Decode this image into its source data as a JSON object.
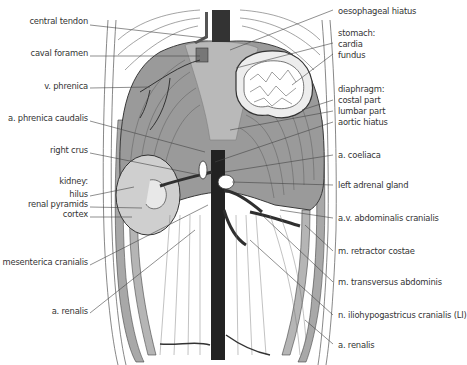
{
  "figure": {
    "colors": {
      "diaphragm": "#9a9a9a",
      "diaphragm_light": "#b9b9b9",
      "kidney": "#cfcfcf",
      "vessel": "#2f2f2f",
      "line": "#4a4a4a",
      "background": "#ffffff"
    },
    "labels_left": [
      {
        "text": "central tendon",
        "x": 98,
        "y": 20
      },
      {
        "text": "caval foramen",
        "x": 98,
        "y": 52
      },
      {
        "text": "v. phrenica",
        "x": 98,
        "y": 85
      },
      {
        "text": "a. phrenica caudalis",
        "x": 98,
        "y": 117
      },
      {
        "text": "right crus",
        "x": 98,
        "y": 149
      },
      {
        "text": "kidney:",
        "x": 98,
        "y": 180
      },
      {
        "text": "hilus",
        "x": 98,
        "y": 193
      },
      {
        "text": "renal pyramids",
        "x": 98,
        "y": 203
      },
      {
        "text": "cortex",
        "x": 98,
        "y": 213
      },
      {
        "text": "a. mesenterica cranialis",
        "x": 98,
        "y": 261
      },
      {
        "text": "a. renalis",
        "x": 98,
        "y": 310
      }
    ],
    "labels_right": [
      {
        "text": "oesophageal hiatus",
        "x": 338,
        "y": 6
      },
      {
        "text": "stomach:",
        "x": 338,
        "y": 29
      },
      {
        "text": "cardia",
        "x": 338,
        "y": 39
      },
      {
        "text": "fundus",
        "x": 338,
        "y": 50
      },
      {
        "text": "diaphragm:",
        "x": 338,
        "y": 85
      },
      {
        "text": "costal part",
        "x": 338,
        "y": 96
      },
      {
        "text": "lumbar part",
        "x": 338,
        "y": 107
      },
      {
        "text": "aortic hiatus",
        "x": 338,
        "y": 118
      },
      {
        "text": "a. coeliaca",
        "x": 338,
        "y": 151
      },
      {
        "text": "left adrenal gland",
        "x": 338,
        "y": 181
      },
      {
        "text": "a.v. abdominalis cranialis",
        "x": 338,
        "y": 214
      },
      {
        "text": "m. retractor costae",
        "x": 338,
        "y": 247
      },
      {
        "text": "m. transversus abdominis",
        "x": 338,
        "y": 278
      },
      {
        "text": "n. iliohypogastricus cranialis (LI)",
        "x": 338,
        "y": 311
      },
      {
        "text": "a. renalis",
        "x": 338,
        "y": 341
      }
    ]
  }
}
